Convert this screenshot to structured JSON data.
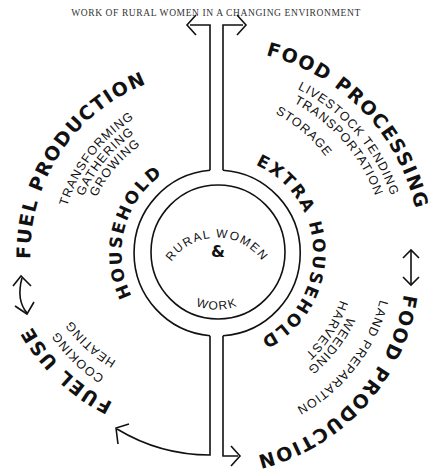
{
  "title": "WORK OF RURAL WOMEN IN A CHANGING ENVIRONMENT",
  "center": {
    "top_label": "RURAL WOMEN",
    "ampersand": "&",
    "bottom_label": "WORK"
  },
  "ring": {
    "left_label": "HOUSEHOLD",
    "right_label": "EXTRA HOUSEHOLD"
  },
  "sectors": {
    "fuel_production": {
      "title": "FUEL PRODUCTION",
      "items": [
        "TRANSFORMING",
        "GATHERING",
        "GROWING"
      ]
    },
    "food_processing": {
      "title": "FOOD PROCESSING",
      "items": [
        "LIVESTOCK TENDING",
        "TRANSPORTATION",
        "STORAGE"
      ]
    },
    "food_production": {
      "title": "FOOD PRODUCTION",
      "items": [
        "LAND PREPARATION",
        "WEEDING",
        "HARVEST"
      ]
    },
    "fuel_use": {
      "title": "FUEL USE",
      "items": [
        "COOKING",
        "HEATING"
      ]
    }
  },
  "colors": {
    "ink": "#111111",
    "title": "#333333",
    "background": "#ffffff"
  }
}
